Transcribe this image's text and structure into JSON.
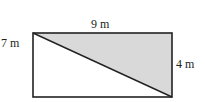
{
  "diagram": {
    "type": "geometry-figure",
    "shapes": {
      "rectangle": {
        "x": 33,
        "y": 33,
        "width": 139,
        "height": 64,
        "stroke": "#222222"
      },
      "shaded_triangle": {
        "points": "33,33 172,33 172,97",
        "fill": "#d9d9d9",
        "stroke": "#222222"
      },
      "diagonal": {
        "x1": 33,
        "y1": 33,
        "x2": 172,
        "y2": 97
      }
    },
    "labels": {
      "top": "9 m",
      "left": "7 m",
      "right": "4 m"
    },
    "colors": {
      "line": "#222222",
      "shade": "#d9d9d9",
      "background": "#ffffff"
    }
  }
}
